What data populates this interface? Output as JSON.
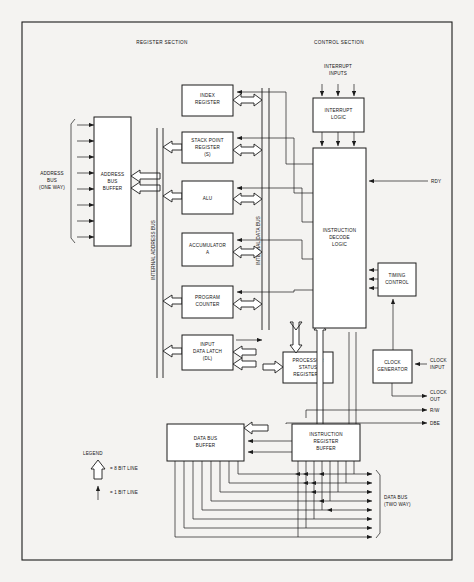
{
  "diagram": {
    "sections": [
      {
        "id": "register",
        "label": "REGISTER SECTION"
      },
      {
        "id": "control",
        "label": "CONTROL SECTION"
      }
    ],
    "blocks": [
      {
        "id": "address-bus-buffer",
        "lines": [
          "ADDRESS",
          "BUS",
          "BUFFER"
        ]
      },
      {
        "id": "index-register",
        "lines": [
          "INDEX",
          "REGISTER"
        ]
      },
      {
        "id": "stack-point-register",
        "lines": [
          "STACK POINT",
          "REGISTER",
          "(S)"
        ]
      },
      {
        "id": "alu",
        "lines": [
          "ALU"
        ]
      },
      {
        "id": "accumulator-a",
        "lines": [
          "ACCUMULATOR",
          "A"
        ]
      },
      {
        "id": "program-counter",
        "lines": [
          "PROGRAM",
          "COUNTER"
        ]
      },
      {
        "id": "input-data-latch",
        "lines": [
          "INPUT",
          "DATA LATCH",
          "(DL)"
        ]
      },
      {
        "id": "processor-status-register",
        "lines": [
          "PROCESSOR",
          "STATUS",
          "REGISTER P"
        ]
      },
      {
        "id": "data-bus-buffer",
        "lines": [
          "DATA BUS",
          "BUFFER"
        ]
      },
      {
        "id": "instruction-register-buffer",
        "lines": [
          "INSTRUCTION",
          "REGISTER",
          "BUFFER"
        ]
      },
      {
        "id": "interrupt-logic",
        "lines": [
          "INTERRUPT",
          "LOGIC"
        ]
      },
      {
        "id": "instruction-decode-logic",
        "lines": [
          "INSTRUCTION",
          "DECODE",
          "LOGIC"
        ]
      },
      {
        "id": "timing-control",
        "lines": [
          "TIMING",
          "CONTROL"
        ]
      },
      {
        "id": "clock-generator",
        "lines": [
          "CLOCK",
          "GENERATOR"
        ]
      }
    ],
    "bus_labels": [
      {
        "id": "internal-address-bus",
        "text": "INTERNAL ADDRESS BUS"
      },
      {
        "id": "internal-data-bus",
        "text": "INTERNAL DATA BUS"
      }
    ],
    "port_labels": [
      {
        "id": "address-bus-port",
        "lines": [
          "ADDRESS",
          "BUS",
          "(ONE WAY)"
        ]
      },
      {
        "id": "data-bus-port",
        "lines": [
          "DATA BUS",
          "(TWO WAY)"
        ]
      },
      {
        "id": "interrupt-inputs",
        "lines": [
          "INTERRUPT",
          "INPUTS"
        ]
      },
      {
        "id": "rdy",
        "lines": [
          "RDY"
        ]
      },
      {
        "id": "clock-input",
        "lines": [
          "CLOCK",
          "INPUT"
        ]
      },
      {
        "id": "clock-out",
        "lines": [
          "CLOCK",
          "OUT"
        ]
      },
      {
        "id": "read-write",
        "lines": [
          "R/W"
        ]
      },
      {
        "id": "dbe",
        "lines": [
          "DBE"
        ]
      }
    ],
    "legend": {
      "title": "LEGEND",
      "entries": [
        {
          "id": "eight-bit-line",
          "symbol": "wide-arrow",
          "text": "= 8 BIT LINE"
        },
        {
          "id": "one-bit-line",
          "symbol": "thin-arrow",
          "text": "= 1 BIT LINE"
        }
      ]
    },
    "counts": {
      "address_bus_lines": 8,
      "data_bus_lines": 8,
      "interrupt_input_lines": 3
    },
    "colors": {
      "page_background": "#f4f3f1",
      "block_fill": "#ffffff",
      "ink": "#1b1b1b"
    }
  }
}
